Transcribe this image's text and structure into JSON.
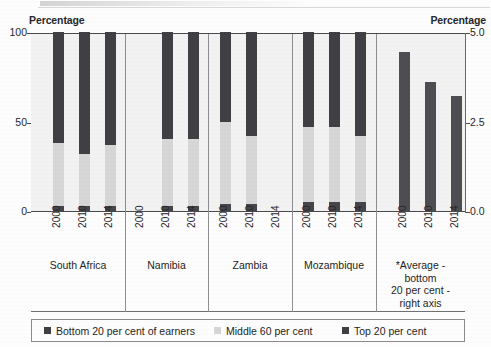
{
  "axes": {
    "left_caption": "Percentage",
    "right_caption": "Percentage",
    "left_ticks": [
      "100",
      "50",
      "0"
    ],
    "right_ticks": [
      "5.0",
      "2.5",
      "0.0"
    ]
  },
  "legend": {
    "items": [
      {
        "label": "Bottom 20 per cent of earners",
        "color": "#3f3f44",
        "key": "bottom"
      },
      {
        "label": "Middle 60 per cent",
        "color": "#d6d6d6",
        "key": "middle"
      },
      {
        "label": "Top 20 per cent",
        "color": "#3f3f44",
        "key": "top"
      }
    ]
  },
  "groups": [
    {
      "name": "South Africa",
      "years": [
        "2000",
        "2010",
        "2014"
      ]
    },
    {
      "name": "Namibia",
      "years": [
        "2000",
        "2010",
        "2014"
      ]
    },
    {
      "name": "Zambia",
      "years": [
        "2000",
        "2010",
        "2014"
      ]
    },
    {
      "name": "Mozambique",
      "years": [
        "2000",
        "2010",
        "2014"
      ]
    },
    {
      "name": "*Average -\nbottom\n20 per cent -\nright axis",
      "years": [
        "2000",
        "2010",
        "2014"
      ]
    }
  ],
  "chart_data": {
    "type": "bar",
    "title": "",
    "subtitle": "",
    "xlabel": "",
    "ylabel": "Percentage",
    "y2label": "Percentage",
    "ylim": [
      0,
      100
    ],
    "y2lim": [
      0,
      5.0
    ],
    "yticks": [
      0,
      50,
      100
    ],
    "y2ticks": [
      0.0,
      2.5,
      5.0
    ],
    "grid": false,
    "stacked": true,
    "legend_position": "bottom",
    "categories": [
      "South Africa 2000",
      "South Africa 2010",
      "South Africa 2014",
      "Namibia 2000",
      "Namibia 2010",
      "Namibia 2014",
      "Zambia 2000",
      "Zambia 2010",
      "Zambia 2014",
      "Mozambique 2000",
      "Mozambique 2010",
      "Mozambique 2014",
      "*Average 2000",
      "*Average 2010",
      "*Average 2014"
    ],
    "series": [
      {
        "name": "Bottom 20 per cent of earners",
        "axis": "left",
        "color": "#3f3f44",
        "values": [
          3,
          3,
          3,
          null,
          3,
          3,
          4,
          4,
          null,
          5,
          5,
          5,
          null,
          null,
          null
        ]
      },
      {
        "name": "Middle 60 per cent",
        "axis": "left",
        "color": "#d6d6d6",
        "values": [
          35,
          29,
          34,
          null,
          37,
          37,
          46,
          38,
          null,
          42,
          42,
          37,
          null,
          null,
          null
        ]
      },
      {
        "name": "Top 20 per cent",
        "axis": "left",
        "color": "#3f3f44",
        "values": [
          62,
          68,
          63,
          null,
          60,
          60,
          50,
          58,
          null,
          53,
          53,
          58,
          null,
          null,
          null
        ]
      },
      {
        "name": "*Average - bottom 20 per cent - right axis",
        "axis": "right",
        "color": "#4d4d52",
        "values": [
          null,
          null,
          null,
          null,
          null,
          null,
          null,
          null,
          null,
          null,
          null,
          null,
          4.45,
          3.6,
          3.2
        ]
      }
    ],
    "notes": [
      "Namibia 2000 has no data (no bar shown).",
      "Zambia 2014 has no data (no bar shown).",
      "The rightmost group plots a single average bar against the right axis (0.0-5.0)."
    ]
  }
}
